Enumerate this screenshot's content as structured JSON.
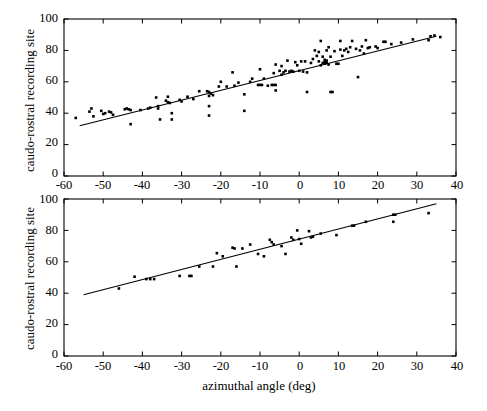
{
  "figure": {
    "background": "#ffffff",
    "ink": "#000000",
    "width": 487,
    "height": 411
  },
  "axis_label_x": "azimuthal angle (deg)",
  "axis_label_y": "caudo-rostral recording site",
  "xticks": [
    "-60",
    "-50",
    "-40",
    "-30",
    "-20",
    "-10",
    "0",
    "10",
    "20",
    "30",
    "40"
  ],
  "yticks": [
    "0",
    "20",
    "40",
    "60",
    "80",
    "100"
  ],
  "chart_data": [
    {
      "type": "scatter",
      "panel": "top",
      "title": "",
      "xlabel": "",
      "ylabel": "caudo-rostral recording site",
      "xlim": [
        -60,
        40
      ],
      "ylim": [
        0,
        100
      ],
      "xticks": [
        -60,
        -50,
        -40,
        -30,
        -20,
        -10,
        0,
        10,
        20,
        30,
        40
      ],
      "yticks": [
        0,
        20,
        40,
        60,
        80,
        100
      ],
      "grid": false,
      "legend": "none",
      "marker": "filled-square-dot",
      "marker_color": "#000000",
      "fit_line": {
        "type": "linear-regression",
        "x": [
          -56,
          35
        ],
        "y": [
          32,
          89
        ],
        "color": "#000000"
      },
      "points": [
        [
          -57.0,
          37.0
        ],
        [
          -53.5,
          41.0
        ],
        [
          -53.0,
          43.0
        ],
        [
          -52.5,
          38.0
        ],
        [
          -50.5,
          41.5
        ],
        [
          -50.0,
          39.5
        ],
        [
          -49.5,
          40.0
        ],
        [
          -48.5,
          41.0
        ],
        [
          -48.0,
          40.5
        ],
        [
          -47.5,
          39.0
        ],
        [
          -44.5,
          42.5
        ],
        [
          -44.0,
          43.0
        ],
        [
          -43.5,
          42.5
        ],
        [
          -43.0,
          42.0
        ],
        [
          -43.0,
          33.0
        ],
        [
          -40.5,
          42.0
        ],
        [
          -38.5,
          43.0
        ],
        [
          -38.0,
          43.5
        ],
        [
          -36.5,
          50.0
        ],
        [
          -36.0,
          44.5
        ],
        [
          -36.0,
          43.0
        ],
        [
          -35.5,
          36.0
        ],
        [
          -34.0,
          48.0
        ],
        [
          -33.5,
          50.5
        ],
        [
          -33.5,
          47.0
        ],
        [
          -33.0,
          46.5
        ],
        [
          -32.5,
          40.0
        ],
        [
          -32.5,
          36.0
        ],
        [
          -30.5,
          48.5
        ],
        [
          -30.0,
          47.5
        ],
        [
          -28.5,
          50.5
        ],
        [
          -27.0,
          49.0
        ],
        [
          -25.5,
          54.0
        ],
        [
          -23.5,
          54.0
        ],
        [
          -23.0,
          53.5
        ],
        [
          -23.0,
          51.0
        ],
        [
          -23.0,
          44.5
        ],
        [
          -23.0,
          38.5
        ],
        [
          -22.5,
          52.5
        ],
        [
          -22.0,
          51.5
        ],
        [
          -20.5,
          57.0
        ],
        [
          -20.0,
          60.0
        ],
        [
          -18.5,
          57.0
        ],
        [
          -17.0,
          66.0
        ],
        [
          -16.5,
          57.5
        ],
        [
          -15.5,
          59.5
        ],
        [
          -14.0,
          52.0
        ],
        [
          -14.0,
          41.5
        ],
        [
          -12.5,
          60.0
        ],
        [
          -12.0,
          62.0
        ],
        [
          -10.5,
          58.0
        ],
        [
          -10.0,
          58.0
        ],
        [
          -9.5,
          58.0
        ],
        [
          -10.0,
          68.0
        ],
        [
          -9.0,
          62.0
        ],
        [
          -8.0,
          57.5
        ],
        [
          -7.0,
          58.0
        ],
        [
          -6.5,
          58.0
        ],
        [
          -6.0,
          58.0
        ],
        [
          -6.5,
          65.5
        ],
        [
          -6.0,
          71.0
        ],
        [
          -6.0,
          54.5
        ],
        [
          -5.0,
          67.0
        ],
        [
          -4.5,
          64.5
        ],
        [
          -4.5,
          70.0
        ],
        [
          -4.0,
          66.0
        ],
        [
          -3.5,
          67.0
        ],
        [
          -3.0,
          73.5
        ],
        [
          -2.5,
          66.5
        ],
        [
          -2.0,
          67.0
        ],
        [
          -1.5,
          66.5
        ],
        [
          -1.0,
          72.5
        ],
        [
          -0.5,
          70.5
        ],
        [
          0.0,
          67.0
        ],
        [
          0.5,
          73.0
        ],
        [
          1.0,
          66.5
        ],
        [
          1.5,
          73.0
        ],
        [
          2.0,
          66.0
        ],
        [
          2.0,
          53.5
        ],
        [
          3.0,
          72.0
        ],
        [
          3.5,
          74.5
        ],
        [
          4.0,
          80.0
        ],
        [
          4.5,
          76.5
        ],
        [
          5.0,
          79.0
        ],
        [
          5.0,
          73.0
        ],
        [
          5.5,
          86.0
        ],
        [
          5.5,
          70.5
        ],
        [
          6.0,
          76.0
        ],
        [
          6.0,
          72.0
        ],
        [
          6.5,
          74.0
        ],
        [
          6.5,
          72.5
        ],
        [
          6.5,
          71.5
        ],
        [
          7.0,
          80.0
        ],
        [
          7.0,
          73.5
        ],
        [
          7.0,
          72.0
        ],
        [
          7.5,
          82.0
        ],
        [
          7.5,
          71.0
        ],
        [
          8.0,
          76.0
        ],
        [
          8.0,
          53.5
        ],
        [
          8.5,
          53.5
        ],
        [
          9.0,
          79.5
        ],
        [
          9.5,
          71.5
        ],
        [
          10.0,
          71.5
        ],
        [
          10.5,
          86.0
        ],
        [
          10.5,
          80.5
        ],
        [
          11.0,
          76.5
        ],
        [
          11.5,
          80.0
        ],
        [
          12.0,
          81.0
        ],
        [
          12.5,
          79.0
        ],
        [
          13.0,
          82.0
        ],
        [
          13.5,
          86.0
        ],
        [
          14.5,
          81.0
        ],
        [
          15.0,
          63.0
        ],
        [
          15.5,
          80.0
        ],
        [
          16.0,
          82.5
        ],
        [
          16.5,
          78.0
        ],
        [
          17.0,
          86.5
        ],
        [
          17.5,
          81.5
        ],
        [
          18.0,
          82.0
        ],
        [
          19.5,
          82.5
        ],
        [
          20.0,
          81.5
        ],
        [
          21.5,
          85.5
        ],
        [
          22.0,
          85.5
        ],
        [
          23.5,
          84.0
        ],
        [
          26.0,
          85.0
        ],
        [
          29.0,
          87.0
        ],
        [
          33.0,
          86.5
        ],
        [
          33.5,
          89.0
        ],
        [
          34.5,
          89.5
        ],
        [
          36.0,
          88.5
        ]
      ]
    },
    {
      "type": "scatter",
      "panel": "bottom",
      "title": "",
      "xlabel": "azimuthal angle (deg)",
      "ylabel": "caudo-rostral recording site",
      "xlim": [
        -60,
        40
      ],
      "ylim": [
        0,
        100
      ],
      "xticks": [
        -60,
        -50,
        -40,
        -30,
        -20,
        -10,
        0,
        10,
        20,
        30,
        40
      ],
      "yticks": [
        0,
        20,
        40,
        60,
        80,
        100
      ],
      "grid": false,
      "legend": "none",
      "marker": "filled-square-dot",
      "marker_color": "#000000",
      "fit_line": {
        "type": "linear-regression",
        "x": [
          -55,
          35
        ],
        "y": [
          39,
          97
        ],
        "color": "#000000"
      },
      "points": [
        [
          -46.0,
          43.0
        ],
        [
          -42.0,
          50.5
        ],
        [
          -39.0,
          49.0
        ],
        [
          -38.0,
          49.0
        ],
        [
          -37.0,
          49.0
        ],
        [
          -30.5,
          51.0
        ],
        [
          -28.0,
          51.0
        ],
        [
          -27.5,
          51.0
        ],
        [
          -25.5,
          57.0
        ],
        [
          -22.0,
          57.0
        ],
        [
          -21.0,
          65.5
        ],
        [
          -19.5,
          63.5
        ],
        [
          -17.0,
          69.0
        ],
        [
          -16.5,
          68.5
        ],
        [
          -16.0,
          57.0
        ],
        [
          -14.5,
          68.5
        ],
        [
          -12.5,
          71.0
        ],
        [
          -10.5,
          65.0
        ],
        [
          -9.0,
          63.5
        ],
        [
          -7.5,
          74.0
        ],
        [
          -7.0,
          72.5
        ],
        [
          -6.5,
          71.0
        ],
        [
          -4.5,
          70.0
        ],
        [
          -3.5,
          65.0
        ],
        [
          -2.0,
          75.5
        ],
        [
          -1.5,
          74.0
        ],
        [
          -0.5,
          80.0
        ],
        [
          0.0,
          74.5
        ],
        [
          0.5,
          71.5
        ],
        [
          2.5,
          79.5
        ],
        [
          3.0,
          75.5
        ],
        [
          3.5,
          76.0
        ],
        [
          5.5,
          78.0
        ],
        [
          9.5,
          77.0
        ],
        [
          13.5,
          83.0
        ],
        [
          14.0,
          83.0
        ],
        [
          17.0,
          85.5
        ],
        [
          24.0,
          90.0
        ],
        [
          24.5,
          90.0
        ],
        [
          24.0,
          85.5
        ],
        [
          33.0,
          91.0
        ]
      ]
    }
  ]
}
